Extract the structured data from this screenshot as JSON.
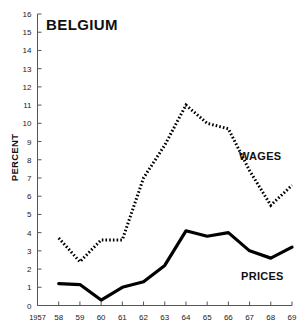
{
  "chart_data": {
    "type": "line",
    "title": "BELGIUM",
    "xlabel": "",
    "ylabel": "PERCENT",
    "ylim": [
      0,
      16
    ],
    "xlim": [
      1957,
      1969
    ],
    "grid": false,
    "legend_position": "inline-annotation",
    "y_ticks": [
      0,
      1,
      2,
      3,
      4,
      5,
      6,
      7,
      8,
      9,
      10,
      11,
      12,
      13,
      14,
      15,
      16
    ],
    "y_tick_labels": [
      "0",
      "1",
      "2",
      "3",
      "4",
      "5",
      "6",
      "7",
      "8",
      "9",
      "10",
      "11",
      "12",
      "13",
      "14",
      "15",
      "16"
    ],
    "x_ticks": [
      1957,
      1958,
      1959,
      1960,
      1961,
      1962,
      1963,
      1964,
      1965,
      1966,
      1967,
      1968,
      1969
    ],
    "x_tick_labels": [
      "1957",
      "58",
      "59",
      "60",
      "61",
      "62",
      "63",
      "64",
      "65",
      "66",
      "67",
      "68",
      "69"
    ],
    "series": [
      {
        "name": "WAGES",
        "style": "dotted",
        "x": [
          1958,
          1959,
          1960,
          1961,
          1962,
          1963,
          1964,
          1965,
          1966,
          1967,
          1968,
          1969
        ],
        "values": [
          3.7,
          2.4,
          3.6,
          3.6,
          7.0,
          8.8,
          11.0,
          10.0,
          9.7,
          7.4,
          5.5,
          6.6
        ]
      },
      {
        "name": "PRICES",
        "style": "solid",
        "x": [
          1958,
          1959,
          1960,
          1961,
          1962,
          1963,
          1964,
          1965,
          1966,
          1967,
          1968,
          1969
        ],
        "values": [
          1.2,
          1.15,
          0.3,
          1.0,
          1.3,
          2.2,
          4.1,
          3.8,
          4.0,
          3.0,
          2.6,
          3.2
        ]
      }
    ],
    "annotations": [
      {
        "text": "WAGES",
        "near_x": 1967,
        "near_y": 8.3
      },
      {
        "text": "PRICES",
        "near_x": 1967.4,
        "near_y": 2.1
      }
    ]
  }
}
